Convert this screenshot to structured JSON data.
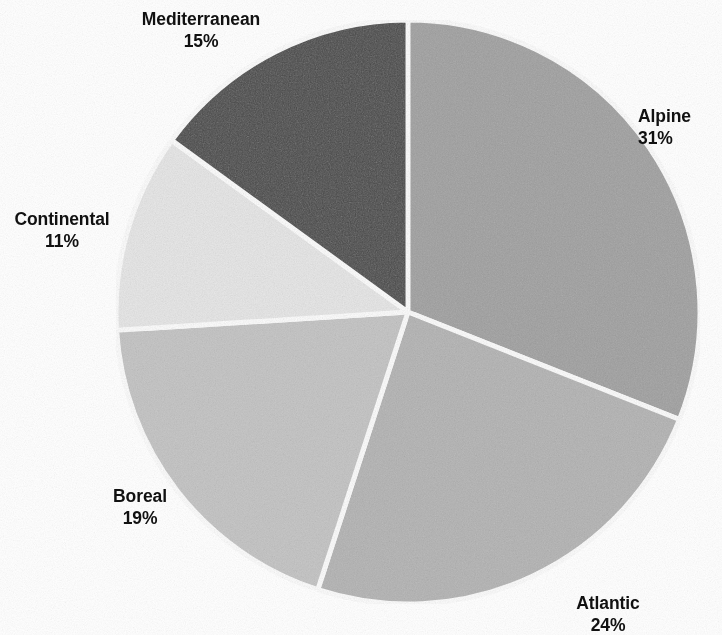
{
  "chart_data": {
    "type": "pie",
    "title": "",
    "subtitle": "",
    "xlabel": "",
    "ylabel": "",
    "legend_position": "none",
    "grid": false,
    "labels_outside": true,
    "start_angle_deg": 0,
    "direction": "clockwise",
    "categories": [
      "Alpine",
      "Atlantic",
      "Boreal",
      "Continental",
      "Mediterranean"
    ],
    "values": [
      31,
      24,
      19,
      11,
      15
    ],
    "unit": "%",
    "slices": [
      {
        "name": "Alpine",
        "value": 31,
        "value_label": "31%",
        "color": "#a3a3a3",
        "start_deg": 0,
        "end_deg": 111.6,
        "label_position": "right"
      },
      {
        "name": "Atlantic",
        "value": 24,
        "value_label": "24%",
        "color": "#b6b6b6",
        "start_deg": 111.6,
        "end_deg": 198.0,
        "label_position": "bottom-right"
      },
      {
        "name": "Boreal",
        "value": 19,
        "value_label": "19%",
        "color": "#c6c6c6",
        "start_deg": 198.0,
        "end_deg": 266.4,
        "label_position": "bottom-left"
      },
      {
        "name": "Continental",
        "value": 11,
        "value_label": "11%",
        "color": "#e9e9e9",
        "start_deg": 266.4,
        "end_deg": 306.0,
        "label_position": "left"
      },
      {
        "name": "Mediterranean",
        "value": 15,
        "value_label": "15%",
        "color": "#4a4a4a",
        "start_deg": 306.0,
        "end_deg": 360.0,
        "label_position": "top"
      }
    ],
    "separator_color": "#ffffff",
    "background_color": "#ffffff",
    "text_color": "#111111",
    "geometry": {
      "center_x": 408,
      "center_y": 312,
      "radius": 292
    }
  },
  "labels": {
    "mediterranean": {
      "name": "Mediterranean",
      "value": "15%"
    },
    "alpine": {
      "name": "Alpine",
      "value": "31%"
    },
    "continental": {
      "name": "Continental",
      "value": "11%"
    },
    "boreal": {
      "name": "Boreal",
      "value": "19%"
    },
    "atlantic": {
      "name": "Atlantic",
      "value": "24%"
    }
  }
}
